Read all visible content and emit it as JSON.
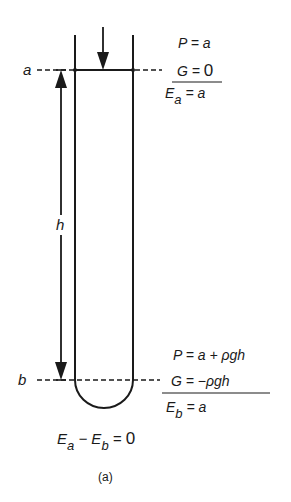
{
  "figure": {
    "caption": "(a)",
    "level_labels": {
      "top": "a",
      "bottom": "b",
      "height": "h"
    },
    "top_equations": {
      "pressure": "P = a",
      "gravity_lhs": "G = ",
      "gravity_rhs": "0",
      "energy_sym": "E",
      "energy_sub": "a",
      "energy_rhs": " = a"
    },
    "bottom_equations": {
      "pressure": "P = a + ρgh",
      "gravity": "G = −ρgh",
      "energy_sym": "E",
      "energy_sub": "b",
      "energy_rhs": " = a"
    },
    "result": {
      "e1": "E",
      "s1": "a",
      "minus": " − ",
      "e2": "E",
      "s2": "b",
      "rhs_eq": " = ",
      "rhs": "0"
    }
  }
}
